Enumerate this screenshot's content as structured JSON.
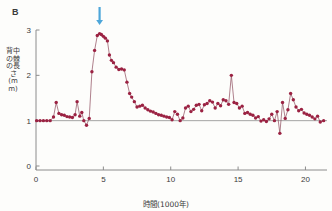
{
  "panel": {
    "label": "B"
  },
  "axes": {
    "y_title": "背中の棘の長さ(mm)",
    "x_title": "時間(1000年)",
    "y_ticks": [
      "0",
      "1",
      "2",
      "3"
    ],
    "x_ticks": [
      "0",
      "5",
      "10",
      "15",
      "20"
    ]
  },
  "annotation": {
    "arrow_name": "down-arrow-marker",
    "arrow_color": "#4da6d9",
    "arrow_x": 4.72
  },
  "style": {
    "marker_color": "#9b2242",
    "line_color": "#8c4a5c",
    "axis_color": "#8c8c8c",
    "reference_line_color": "#9a9a9a"
  },
  "chart_data": {
    "type": "line",
    "title": "B",
    "xlabel": "時間(1000年)",
    "ylabel": "背中の棘の長さ(mm)",
    "xlim": [
      0,
      21.6
    ],
    "ylim": [
      0,
      3.15
    ],
    "xticks": [
      0,
      5,
      10,
      15,
      20
    ],
    "yticks": [
      0,
      1,
      2,
      3
    ],
    "grid": false,
    "legend": null,
    "reference_line_y": 1.0,
    "annotations": [
      {
        "type": "arrow",
        "x": 4.72,
        "y": 3.05,
        "direction": "down",
        "color": "#4da6d9"
      }
    ],
    "series": [
      {
        "name": "背中の棘の長さ",
        "marker": "circle",
        "color": "#9b2242",
        "x": [
          0.05,
          0.3,
          0.55,
          0.8,
          1.05,
          1.3,
          1.5,
          1.7,
          1.9,
          2.1,
          2.3,
          2.5,
          2.7,
          2.9,
          3.05,
          3.25,
          3.4,
          3.55,
          3.75,
          3.95,
          4.15,
          4.35,
          4.55,
          4.72,
          4.85,
          5.0,
          5.15,
          5.3,
          5.45,
          5.6,
          5.75,
          5.95,
          6.15,
          6.35,
          6.55,
          6.75,
          6.95,
          7.1,
          7.3,
          7.5,
          7.7,
          7.9,
          8.1,
          8.3,
          8.5,
          8.7,
          8.9,
          9.1,
          9.3,
          9.5,
          9.7,
          9.9,
          10.1,
          10.3,
          10.5,
          10.7,
          10.9,
          11.1,
          11.3,
          11.5,
          11.7,
          11.9,
          12.1,
          12.3,
          12.5,
          12.7,
          12.9,
          13.1,
          13.3,
          13.5,
          13.7,
          13.9,
          14.1,
          14.3,
          14.5,
          14.7,
          14.9,
          15.1,
          15.3,
          15.5,
          15.7,
          15.9,
          16.1,
          16.3,
          16.5,
          16.7,
          16.9,
          17.1,
          17.3,
          17.5,
          17.7,
          17.9,
          18.1,
          18.3,
          18.5,
          18.7,
          18.9,
          19.1,
          19.3,
          19.5,
          19.7,
          19.9,
          20.1,
          20.3,
          20.5,
          20.7,
          20.9,
          21.1,
          21.35
        ],
        "y": [
          1.0,
          1.0,
          1.0,
          1.0,
          1.0,
          1.08,
          1.4,
          1.16,
          1.13,
          1.12,
          1.09,
          1.08,
          1.07,
          1.13,
          1.42,
          1.1,
          1.18,
          1.0,
          0.9,
          1.05,
          2.08,
          2.55,
          2.88,
          2.92,
          2.9,
          2.86,
          2.82,
          2.76,
          2.45,
          2.33,
          2.28,
          2.18,
          2.13,
          2.14,
          2.12,
          1.85,
          1.6,
          1.52,
          1.42,
          1.3,
          1.32,
          1.34,
          1.28,
          1.24,
          1.21,
          1.19,
          1.16,
          1.13,
          1.12,
          1.1,
          1.08,
          1.07,
          1.02,
          1.2,
          1.14,
          1.0,
          1.06,
          1.28,
          1.32,
          1.2,
          1.25,
          1.34,
          1.36,
          1.22,
          1.35,
          1.38,
          1.44,
          1.41,
          1.28,
          1.38,
          1.33,
          1.46,
          1.44,
          1.36,
          2.0,
          1.4,
          1.38,
          1.28,
          1.32,
          1.16,
          1.18,
          1.14,
          1.12,
          1.06,
          1.09,
          0.99,
          1.02,
          0.98,
          1.04,
          1.14,
          1.0,
          1.2,
          0.72,
          1.4,
          1.05,
          1.24,
          1.6,
          1.46,
          1.3,
          1.22,
          1.25,
          1.17,
          1.14,
          1.12,
          1.08,
          1.04,
          1.1,
          0.97,
          1.0
        ]
      }
    ]
  }
}
